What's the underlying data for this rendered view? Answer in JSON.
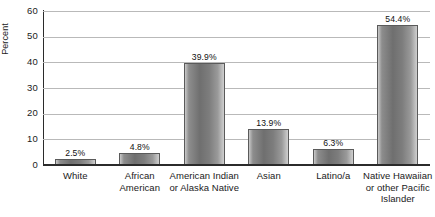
{
  "chart_data": {
    "type": "bar",
    "title": "",
    "xlabel": "",
    "ylabel": "Percent",
    "ylim": [
      0,
      60
    ],
    "yticks": [
      0,
      10,
      20,
      30,
      40,
      50,
      60
    ],
    "ytick_labels": [
      "0",
      "10",
      "20",
      "30",
      "40",
      "50",
      "60"
    ],
    "grid": true,
    "legend": false,
    "categories": [
      "White",
      "African American",
      "American Indian or Alaska Native",
      "Asian",
      "Latino/a",
      "Native Hawaiian or other Pacific Islander"
    ],
    "category_lines": [
      [
        "White"
      ],
      [
        "African",
        "American"
      ],
      [
        "American Indian",
        "or Alaska Native"
      ],
      [
        "Asian"
      ],
      [
        "Latino/a"
      ],
      [
        "Native Hawaiian",
        "or other Pacific",
        "Islander"
      ]
    ],
    "values": [
      2.5,
      4.8,
      39.9,
      13.9,
      6.3,
      54.4
    ],
    "value_labels": [
      "2.5%",
      "4.8%",
      "39.9%",
      "13.9%",
      "6.3%",
      "54.4%"
    ],
    "bar_color": "#808080",
    "axis_color": "#2b2b2b",
    "gridline_color": "#b9b9b9"
  }
}
